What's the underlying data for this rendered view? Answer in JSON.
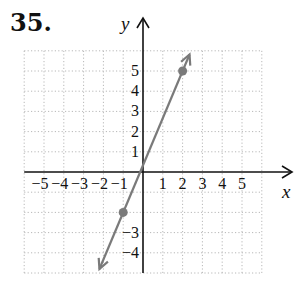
{
  "problem": {
    "number": "35."
  },
  "chart_data": {
    "type": "line",
    "title": "",
    "xlabel": "x",
    "ylabel": "y",
    "xlim": [
      -6,
      6
    ],
    "ylim": [
      -5,
      6
    ],
    "grid": true,
    "x_tick_labels": [
      "−5",
      "−4",
      "−3",
      "−2",
      "−1",
      "1",
      "2",
      "3",
      "4",
      "5"
    ],
    "y_tick_labels": [
      "5",
      "4",
      "3",
      "2",
      "1",
      "−3",
      "−4"
    ],
    "series": [
      {
        "name": "line",
        "equation": "y = (7/3)x + 1/3",
        "points": [
          [
            -1,
            -2
          ],
          [
            2,
            5
          ]
        ],
        "arrows": "both",
        "color": "#7a7a7a"
      }
    ]
  },
  "colors": {
    "line": "#7a7a7a",
    "axis": "#111111",
    "grid": "#b8b8b8"
  }
}
